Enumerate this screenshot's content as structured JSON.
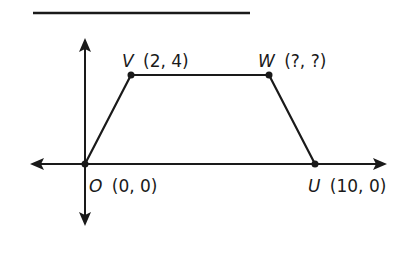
{
  "diagram": {
    "type": "coordinate-plane-trapezoid",
    "colors": {
      "stroke": "#1a1a1a",
      "background": "#ffffff"
    },
    "answer_line": {
      "x1": 33,
      "y1": 13,
      "x2": 250,
      "y2": 13
    },
    "axes": {
      "x_axis": {
        "y": 164,
        "x_start": 30,
        "x_end": 387
      },
      "y_axis": {
        "x": 85,
        "y_start": 38,
        "y_end": 226
      }
    },
    "points": [
      {
        "name": "O",
        "coords": "(0, 0)",
        "px": 85,
        "py": 164,
        "label_x": 89,
        "label_y": 192
      },
      {
        "name": "V",
        "coords": "(2, 4)",
        "px": 131,
        "py": 75,
        "label_x": 122,
        "label_y": 67
      },
      {
        "name": "W",
        "coords": "(?, ?)",
        "px": 269,
        "py": 75,
        "label_x": 258,
        "label_y": 67
      },
      {
        "name": "U",
        "coords": "(10, 0)",
        "px": 315,
        "py": 164,
        "label_x": 308,
        "label_y": 192
      }
    ],
    "labels": {
      "O": {
        "letter": "O",
        "coords": "(0, 0)"
      },
      "V": {
        "letter": "V",
        "coords": "(2, 4)"
      },
      "W": {
        "letter": "W",
        "coords": "(?, ?)"
      },
      "U": {
        "letter": "U",
        "coords": "(10, 0)"
      }
    }
  }
}
